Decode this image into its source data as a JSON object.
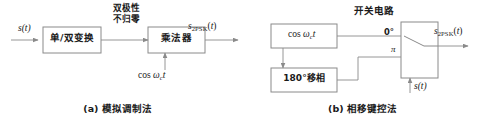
{
  "figure": {
    "colors": {
      "line": "#8a8a8a",
      "box_border": "#8a8a8a",
      "text": "#1a1a1a",
      "background": "#ffffff"
    }
  },
  "panel_a": {
    "caption": "(a) 模拟调制法",
    "input_signal": "s(t)",
    "blocks": [
      {
        "label": "单/双变换"
      },
      {
        "label": "乘法器"
      }
    ],
    "wire_annotation_line1": "双极性",
    "wire_annotation_line2": "不归零",
    "carrier_label": "cos ω",
    "carrier_sub": "c",
    "carrier_tail": "t",
    "output_main": "s",
    "output_sub": "2PSK",
    "output_tail": "(t)"
  },
  "panel_b": {
    "caption": "(b) 相移键控法",
    "switch_title": "开关电路",
    "blocks": [
      {
        "label": "cos ω",
        "sub": "c",
        "tail": "t"
      },
      {
        "label": "180°移相"
      }
    ],
    "terminal_top": "0°",
    "terminal_bottom": "π",
    "control_signal": "s(t)",
    "output_main": "s",
    "output_sub": "2PSK",
    "output_tail": "(t)"
  }
}
